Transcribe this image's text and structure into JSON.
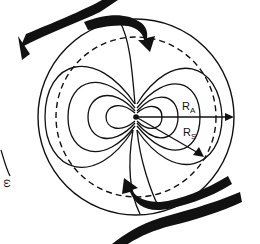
{
  "diagram": {
    "type": "dipole magnetosphere field lines with plasma flow arrows",
    "center": [
      136,
      117
    ],
    "labels": {
      "alfven_radius": {
        "main": "R",
        "sub": "A"
      },
      "stopping_radius": {
        "main": "R",
        "sub": "S"
      },
      "rotation": "ω"
    },
    "elements": [
      "outer circle (R_A)",
      "dashed circle (R_S)",
      "dipole field lines",
      "inflow arrow top",
      "inflow arrow bottom",
      "rotation arc with omega symbol"
    ],
    "colors": {
      "ink": "#111111",
      "background": "#ffffff"
    }
  }
}
